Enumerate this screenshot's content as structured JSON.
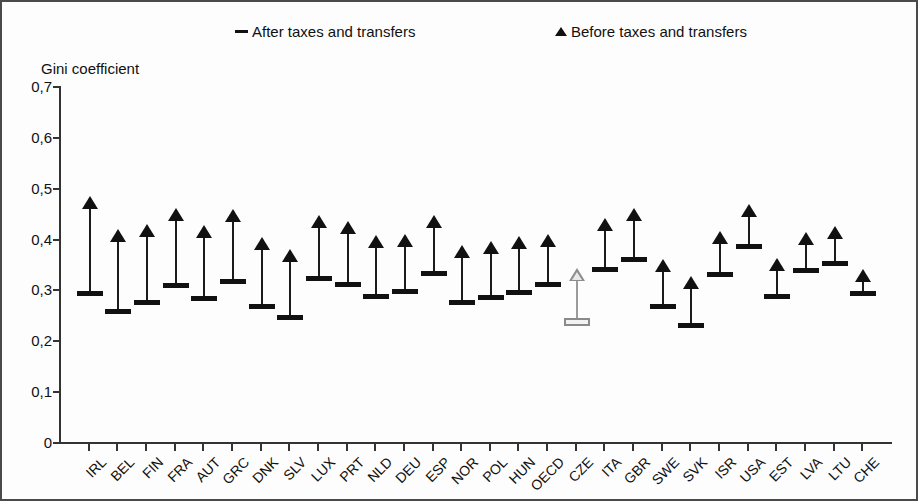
{
  "legend": {
    "after_label": "After taxes and transfers",
    "after_marker": "dash-marker",
    "before_label": "Before taxes and transfers",
    "before_marker": "triangle-marker"
  },
  "axis_title": "Gini coefficient",
  "chart_data": {
    "type": "scatter",
    "title": "",
    "subtitle": "",
    "xlabel": "",
    "ylabel": "Gini coefficient",
    "ylim": [
      0,
      0.7
    ],
    "ytick_labels": [
      "0,7",
      "0,6",
      "0,5",
      "0,4",
      "0,3",
      "0,2",
      "0,1",
      "0"
    ],
    "ytick_values": [
      0.7,
      0.6,
      0.5,
      0.4,
      0.3,
      0.2,
      0.1,
      0
    ],
    "grid": false,
    "legend_position": "top",
    "highlighted_category": "CZE",
    "categories": [
      "IRL",
      "BEL",
      "FIN",
      "FRA",
      "AUT",
      "GRC",
      "DNK",
      "SLV",
      "LUX",
      "PRT",
      "NLD",
      "DEU",
      "ESP",
      "NOR",
      "POL",
      "HUN",
      "OECD",
      "CZE",
      "ITA",
      "GBR",
      "SWE",
      "SVK",
      "ISR",
      "USA",
      "EST",
      "LVA",
      "LTU",
      "CHE"
    ],
    "series": [
      {
        "name": "Before taxes and transfers",
        "marker": "triangle",
        "values": [
          0.479,
          0.414,
          0.425,
          0.457,
          0.423,
          0.454,
          0.4,
          0.375,
          0.443,
          0.43,
          0.403,
          0.406,
          0.443,
          0.383,
          0.392,
          0.402,
          0.406,
          0.338,
          0.437,
          0.456,
          0.355,
          0.322,
          0.411,
          0.464,
          0.358,
          0.409,
          0.42,
          0.336
        ]
      },
      {
        "name": "After taxes and transfers",
        "marker": "dash",
        "values": [
          0.293,
          0.258,
          0.276,
          0.308,
          0.284,
          0.317,
          0.267,
          0.245,
          0.322,
          0.311,
          0.288,
          0.297,
          0.333,
          0.276,
          0.286,
          0.295,
          0.311,
          0.24,
          0.34,
          0.36,
          0.267,
          0.231,
          0.33,
          0.385,
          0.288,
          0.338,
          0.352,
          0.293
        ]
      }
    ]
  }
}
